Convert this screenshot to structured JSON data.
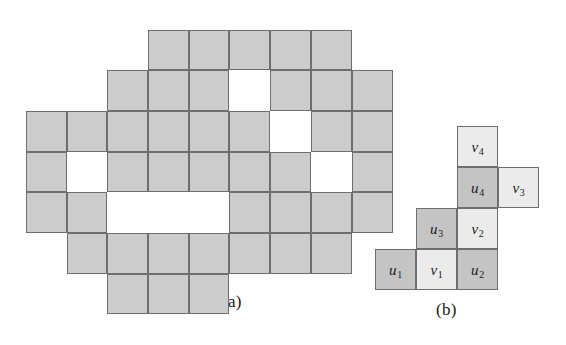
{
  "figure": {
    "panels": [
      {
        "id": "a",
        "caption": "(a)",
        "caption_x": 222,
        "caption_y": 292,
        "type": "polyomino-grid",
        "cell_size": 41,
        "origin_x": 26,
        "origin_y": 30,
        "columns": 9,
        "rows": 7,
        "col_edges": [
          26,
          67,
          107,
          148,
          189,
          229,
          270,
          311,
          352,
          393
        ],
        "row_edges": [
          30,
          70,
          111,
          152,
          192,
          233,
          274,
          314
        ],
        "cells": [
          {
            "r": 0,
            "c": 3,
            "state": "filled"
          },
          {
            "r": 0,
            "c": 4,
            "state": "filled"
          },
          {
            "r": 0,
            "c": 5,
            "state": "filled"
          },
          {
            "r": 0,
            "c": 6,
            "state": "filled"
          },
          {
            "r": 0,
            "c": 7,
            "state": "filled"
          },
          {
            "r": 1,
            "c": 2,
            "state": "filled"
          },
          {
            "r": 1,
            "c": 3,
            "state": "filled"
          },
          {
            "r": 1,
            "c": 4,
            "state": "filled"
          },
          {
            "r": 1,
            "c": 5,
            "state": "hole"
          },
          {
            "r": 1,
            "c": 6,
            "state": "filled"
          },
          {
            "r": 1,
            "c": 7,
            "state": "filled"
          },
          {
            "r": 1,
            "c": 8,
            "state": "filled"
          },
          {
            "r": 2,
            "c": 0,
            "state": "filled"
          },
          {
            "r": 2,
            "c": 1,
            "state": "filled"
          },
          {
            "r": 2,
            "c": 2,
            "state": "filled"
          },
          {
            "r": 2,
            "c": 3,
            "state": "filled"
          },
          {
            "r": 2,
            "c": 4,
            "state": "filled"
          },
          {
            "r": 2,
            "c": 5,
            "state": "filled"
          },
          {
            "r": 2,
            "c": 6,
            "state": "hole"
          },
          {
            "r": 2,
            "c": 7,
            "state": "filled"
          },
          {
            "r": 2,
            "c": 8,
            "state": "filled"
          },
          {
            "r": 3,
            "c": 0,
            "state": "filled"
          },
          {
            "r": 3,
            "c": 1,
            "state": "hole"
          },
          {
            "r": 3,
            "c": 2,
            "state": "filled"
          },
          {
            "r": 3,
            "c": 3,
            "state": "filled"
          },
          {
            "r": 3,
            "c": 4,
            "state": "filled"
          },
          {
            "r": 3,
            "c": 5,
            "state": "filled"
          },
          {
            "r": 3,
            "c": 6,
            "state": "filled"
          },
          {
            "r": 3,
            "c": 7,
            "state": "hole"
          },
          {
            "r": 3,
            "c": 8,
            "state": "filled"
          },
          {
            "r": 4,
            "c": 0,
            "state": "filled"
          },
          {
            "r": 4,
            "c": 1,
            "state": "filled"
          },
          {
            "r": 4,
            "c": 2,
            "state": "hole"
          },
          {
            "r": 4,
            "c": 3,
            "state": "hole"
          },
          {
            "r": 4,
            "c": 4,
            "state": "hole"
          },
          {
            "r": 4,
            "c": 5,
            "state": "filled"
          },
          {
            "r": 4,
            "c": 6,
            "state": "filled"
          },
          {
            "r": 4,
            "c": 7,
            "state": "filled"
          },
          {
            "r": 4,
            "c": 8,
            "state": "filled"
          },
          {
            "r": 5,
            "c": 1,
            "state": "filled"
          },
          {
            "r": 5,
            "c": 2,
            "state": "filled"
          },
          {
            "r": 5,
            "c": 3,
            "state": "filled"
          },
          {
            "r": 5,
            "c": 4,
            "state": "filled"
          },
          {
            "r": 5,
            "c": 5,
            "state": "filled"
          },
          {
            "r": 5,
            "c": 6,
            "state": "filled"
          },
          {
            "r": 5,
            "c": 7,
            "state": "filled"
          },
          {
            "r": 6,
            "c": 2,
            "state": "filled"
          },
          {
            "r": 6,
            "c": 3,
            "state": "filled"
          },
          {
            "r": 6,
            "c": 4,
            "state": "filled"
          }
        ]
      },
      {
        "id": "b",
        "caption": "(b)",
        "caption_x": 436,
        "caption_y": 300,
        "type": "labeled-staircase",
        "cell_size": 41,
        "origin_x": 375,
        "origin_y": 126,
        "labeled_cells": [
          {
            "label": "u",
            "index": "1",
            "r": 3,
            "c": 0,
            "shade": "dark"
          },
          {
            "label": "v",
            "index": "1",
            "r": 3,
            "c": 1,
            "shade": "light"
          },
          {
            "label": "u",
            "index": "2",
            "r": 3,
            "c": 2,
            "shade": "dark"
          },
          {
            "label": "u",
            "index": "3",
            "r": 2,
            "c": 1,
            "shade": "dark"
          },
          {
            "label": "v",
            "index": "2",
            "r": 2,
            "c": 2,
            "shade": "light"
          },
          {
            "label": "u",
            "index": "4",
            "r": 1,
            "c": 2,
            "shade": "dark"
          },
          {
            "label": "v",
            "index": "3",
            "r": 1,
            "c": 3,
            "shade": "light"
          },
          {
            "label": "v",
            "index": "4",
            "r": 0,
            "c": 2,
            "shade": "light"
          }
        ]
      }
    ]
  },
  "colors": {
    "filled": "#cccccc",
    "dark_cell": "#c4c4c4",
    "light_cell": "#ebebeb",
    "hole": "#ffffff",
    "stroke": "#6e6e6e",
    "text": "#171717",
    "background": "#ffffff"
  }
}
